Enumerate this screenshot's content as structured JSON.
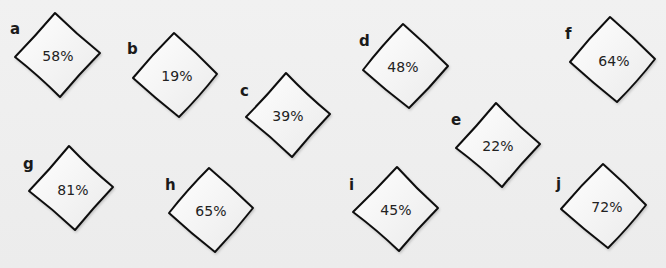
{
  "cards": [
    {
      "id": "a",
      "label": "a",
      "value": "58%",
      "lx": 10,
      "ly": 22,
      "top": [
        55,
        13
      ],
      "right": [
        100,
        53
      ],
      "bottom": [
        60,
        97
      ],
      "left": [
        15,
        57
      ],
      "tx": 58,
      "ty": 56
    },
    {
      "id": "b",
      "label": "b",
      "value": "19%",
      "lx": 127,
      "ly": 42,
      "top": [
        174,
        33
      ],
      "right": [
        217,
        74
      ],
      "bottom": [
        179,
        117
      ],
      "left": [
        133,
        78
      ],
      "tx": 177,
      "ty": 76
    },
    {
      "id": "c",
      "label": "c",
      "value": "39%",
      "lx": 240,
      "ly": 84,
      "top": [
        286,
        73
      ],
      "right": [
        330,
        114
      ],
      "bottom": [
        292,
        157
      ],
      "left": [
        246,
        117
      ],
      "tx": 288,
      "ty": 116
    },
    {
      "id": "d",
      "label": "d",
      "value": "48%",
      "lx": 359,
      "ly": 34,
      "top": [
        403,
        24
      ],
      "right": [
        448,
        66
      ],
      "bottom": [
        409,
        108
      ],
      "left": [
        363,
        70
      ],
      "tx": 403,
      "ty": 67
    },
    {
      "id": "e",
      "label": "e",
      "value": "22%",
      "lx": 451,
      "ly": 113,
      "top": [
        496,
        103
      ],
      "right": [
        540,
        144
      ],
      "bottom": [
        502,
        187
      ],
      "left": [
        456,
        148
      ],
      "tx": 498,
      "ty": 146
    },
    {
      "id": "f",
      "label": "f",
      "value": "64%",
      "lx": 565,
      "ly": 27,
      "top": [
        610,
        17
      ],
      "right": [
        655,
        59
      ],
      "bottom": [
        617,
        102
      ],
      "left": [
        570,
        62
      ],
      "tx": 614,
      "ty": 61
    },
    {
      "id": "g",
      "label": "g",
      "value": "81%",
      "lx": 23,
      "ly": 157,
      "top": [
        69,
        146
      ],
      "right": [
        113,
        187
      ],
      "bottom": [
        75,
        230
      ],
      "left": [
        29,
        191
      ],
      "tx": 73,
      "ty": 190
    },
    {
      "id": "h",
      "label": "h",
      "value": "65%",
      "lx": 165,
      "ly": 178,
      "top": [
        209,
        168
      ],
      "right": [
        253,
        208
      ],
      "bottom": [
        215,
        252
      ],
      "left": [
        169,
        213
      ],
      "tx": 211,
      "ty": 211
    },
    {
      "id": "i",
      "label": "i",
      "value": "45%",
      "lx": 349,
      "ly": 178,
      "top": [
        397,
        167
      ],
      "right": [
        438,
        208
      ],
      "bottom": [
        399,
        251
      ],
      "left": [
        353,
        212
      ],
      "tx": 396,
      "ty": 210
    },
    {
      "id": "j",
      "label": "j",
      "value": "72%",
      "lx": 556,
      "ly": 177,
      "top": [
        603,
        164
      ],
      "right": [
        646,
        205
      ],
      "bottom": [
        608,
        248
      ],
      "left": [
        561,
        209
      ],
      "tx": 607,
      "ty": 207
    }
  ],
  "colors": {
    "background": "#efefef",
    "card_fill": "#ffffff",
    "card_stroke": "#111111",
    "text": "#222222"
  }
}
